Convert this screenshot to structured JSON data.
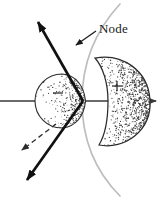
{
  "figure": {
    "title_visible": false,
    "background_color": "#ffffff",
    "width": 168,
    "height": 199,
    "labels": {
      "node": "Node",
      "positive_sign": "+",
      "negative_sign": "−"
    },
    "colors": {
      "ink": "#1a1a1a",
      "axis": "#3a3a3a",
      "node_curve": "#b9b9b9",
      "lobe_outline": "#2b2b2b",
      "stipple": "#3d3d3d",
      "dashed_arrow": "#2b2b2b",
      "background": "#ffffff"
    },
    "elements": {
      "axis": {
        "name": "horizontal-axis",
        "direction": "right",
        "has_arrowhead": true,
        "y": 101
      },
      "left_lobe": {
        "name": "negative-lobe",
        "shape": "circle",
        "sign": "−",
        "center_x": 62,
        "center_y": 101,
        "radius": 27,
        "shading": "stippled"
      },
      "right_lobe": {
        "name": "positive-lobe",
        "shape": "kidney",
        "sign": "+",
        "center_x": 117,
        "center_y": 101,
        "shading": "stippled"
      },
      "node_curve": {
        "name": "node-curve",
        "shape": "parabola",
        "color": "#b9b9b9"
      },
      "bold_line": {
        "name": "bold-double-arrow",
        "arrowheads": [
          "top-left",
          "bottom-left"
        ],
        "color": "#111111"
      },
      "dashed_arrow": {
        "name": "dashed-arrow",
        "direction": "down-left",
        "style": "dashed"
      },
      "node_pointer": {
        "name": "node-pointer-arrow",
        "direction": "up-left"
      }
    },
    "stipple_seed": 20250214
  }
}
